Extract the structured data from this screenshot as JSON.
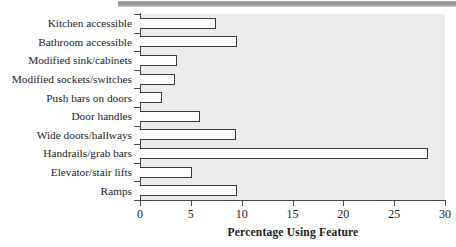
{
  "chart_data": {
    "type": "bar",
    "orientation": "horizontal",
    "title": "",
    "xlabel": "Percentage Using Feature",
    "ylabel": "",
    "xlim": [
      0,
      30
    ],
    "xticks": [
      0,
      5,
      10,
      15,
      20,
      25,
      30
    ],
    "grid": false,
    "legend": null,
    "categories": [
      "Kitchen accessible",
      "Bathroom accessible",
      "Modified sink/cabinets",
      "Modified sockets/switches",
      "Push bars on doors",
      "Door handles",
      "Wide doors/hallways",
      "Handrails/grab bars",
      "Elevator/stair lifts",
      "Ramps"
    ],
    "values": [
      7.5,
      9.5,
      3.6,
      3.4,
      2.2,
      5.9,
      9.4,
      28.3,
      5.1,
      9.5
    ],
    "bar_facecolor": "#fdfdfd",
    "bar_edgecolor": "#3a3a3a",
    "plot_background": "#ebebeb",
    "axis_color": "#4a4a4a"
  }
}
